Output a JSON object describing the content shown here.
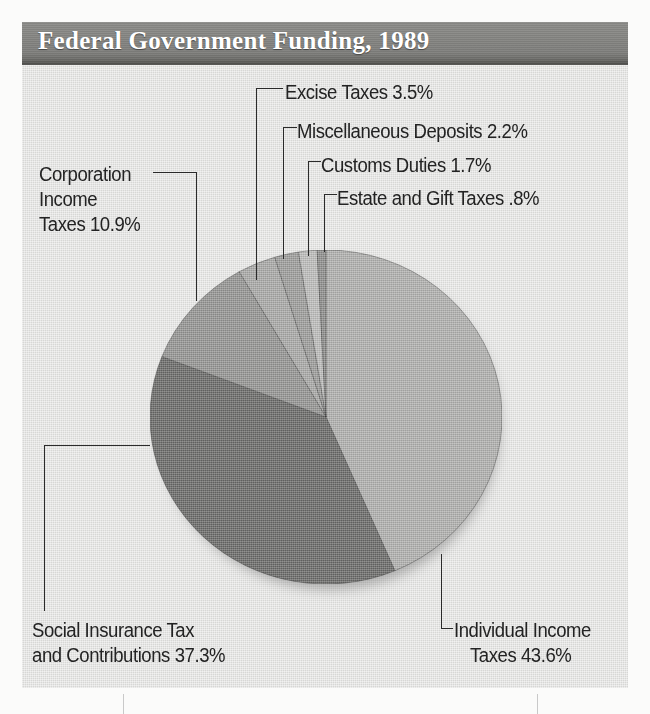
{
  "banner": {
    "title": "Federal Government Funding, 1989"
  },
  "labels": {
    "excise": "Excise Taxes 3.5%",
    "misc": "Miscellaneous Deposits 2.2%",
    "customs": "Customs Duties 1.7%",
    "estate": "Estate and Gift Taxes .8%",
    "corporation_l1": "Corporation",
    "corporation_l2": "Income",
    "corporation_l3": "Taxes 10.9%",
    "social_l1": "Social Insurance Tax",
    "social_l2": "and Contributions 37.3%",
    "individual_l1": "Individual Income",
    "individual_l2": "Taxes 43.6%"
  },
  "colors": {
    "panel_bg": "#e3e3e1",
    "banner_gray": "#7f7f7c",
    "banner_text": "#ffffff",
    "label_text": "#232323",
    "leader_line": "#2a2a2a",
    "slice_individual": "#b0b0ae",
    "slice_social": "#6a6a68",
    "slice_corporation": "#949492",
    "slice_excise": "#a9a9a7",
    "slice_misc": "#9d9d9b",
    "slice_customs": "#bdbdbb",
    "slice_estate": "#8e8e8c"
  },
  "chart_data": {
    "type": "pie",
    "title": "Federal Government Funding, 1989",
    "subtitle": "",
    "xlabel": "",
    "ylabel": "",
    "units": "percent of total federal funding",
    "legend_position": "callout-labels",
    "grid": false,
    "start_angle_deg": 0,
    "direction": "clockwise",
    "total": 100.0,
    "labels": [
      "Individual Income Taxes",
      "Social Insurance Tax and Contributions",
      "Corporation Income Taxes",
      "Excise Taxes",
      "Miscellaneous Deposits",
      "Customs Duties",
      "Estate and Gift Taxes"
    ],
    "values": [
      43.6,
      37.3,
      10.9,
      3.5,
      2.2,
      1.7,
      0.8
    ],
    "slices": [
      {
        "label": "Individual Income Taxes",
        "value": 43.6,
        "display": "43.6%",
        "color": "#b0b0ae"
      },
      {
        "label": "Social Insurance Tax and Contributions",
        "value": 37.3,
        "display": "37.3%",
        "color": "#6a6a68"
      },
      {
        "label": "Corporation Income Taxes",
        "value": 10.9,
        "display": "10.9%",
        "color": "#949492"
      },
      {
        "label": "Excise Taxes",
        "value": 3.5,
        "display": "3.5%",
        "color": "#a9a9a7"
      },
      {
        "label": "Miscellaneous Deposits",
        "value": 2.2,
        "display": "2.2%",
        "color": "#9d9d9b"
      },
      {
        "label": "Customs Duties",
        "value": 1.7,
        "display": "1.7%",
        "color": "#bdbdbb"
      },
      {
        "label": "Estate and Gift Taxes",
        "value": 0.8,
        "display": ".8%",
        "color": "#8e8e8c"
      }
    ]
  }
}
